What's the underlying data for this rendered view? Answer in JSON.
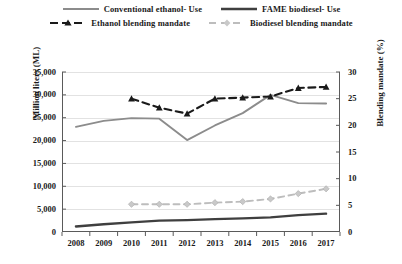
{
  "chart_data": {
    "type": "line",
    "title": "",
    "xlabel": "",
    "ylabel": "Million liters (ML)",
    "ylabel_right": "Blending mandate (%)",
    "x": [
      2008,
      2009,
      2010,
      2011,
      2012,
      2013,
      2014,
      2015,
      2016,
      2017
    ],
    "categories": [
      "2008",
      "2009",
      "2010",
      "2011",
      "2012",
      "2013",
      "2014",
      "2015",
      "2016",
      "2017"
    ],
    "ylim": [
      0,
      35000
    ],
    "ylim_right": [
      0,
      30
    ],
    "yticks": [
      "0",
      "5,000",
      "10,000",
      "15,000",
      "20,000",
      "25,000",
      "30,000",
      "35,000"
    ],
    "ytick_values": [
      0,
      5000,
      10000,
      15000,
      20000,
      25000,
      30000,
      35000
    ],
    "yticks_right": [
      "0",
      "5",
      "10",
      "15",
      "20",
      "25",
      "30"
    ],
    "ytick_values_right": [
      0,
      5,
      10,
      15,
      20,
      25,
      30
    ],
    "grid": true,
    "legend_position": "top",
    "series": [
      {
        "name": "Conventional ethanol- Use",
        "axis": "left",
        "unit": "ML",
        "color": "#8c8c8c",
        "style": "solid",
        "marker": "none",
        "values": [
          23000,
          24300,
          24900,
          24800,
          20100,
          23300,
          26000,
          30000,
          28200,
          28100
        ]
      },
      {
        "name": "FAME biodiesel- Use",
        "axis": "left",
        "unit": "ML",
        "color": "#3f3f3f",
        "style": "solid",
        "marker": "none",
        "values": [
          1200,
          1700,
          2100,
          2500,
          2600,
          2800,
          3000,
          3200,
          3700,
          4000
        ]
      },
      {
        "name": "Ethanol blending mandate",
        "axis": "right",
        "unit": "%",
        "color": "#1a1a1a",
        "style": "dashed",
        "marker": "triangle",
        "values": [
          null,
          null,
          25.0,
          23.3,
          22.2,
          25.0,
          25.2,
          25.4,
          27.0,
          27.2
        ]
      },
      {
        "name": "Biodiesel blending mandate",
        "axis": "right",
        "unit": "%",
        "color": "#bdbdbd",
        "style": "dashed",
        "marker": "diamond",
        "values": [
          null,
          null,
          5.2,
          5.2,
          5.2,
          5.5,
          5.7,
          6.2,
          7.2,
          8.1
        ]
      }
    ]
  },
  "legend": {
    "rows": [
      [
        {
          "label": "Conventional ethanol- Use",
          "swatch": "solid-gray-line"
        },
        {
          "label": "FAME biodiesel- Use",
          "swatch": "solid-dark-line"
        }
      ],
      [
        {
          "label": "Ethanol blending mandate",
          "swatch": "dashed-dark-line-triangle"
        },
        {
          "label": "Biodiesel blending mandate",
          "swatch": "dashed-light-line-diamond"
        }
      ]
    ]
  }
}
